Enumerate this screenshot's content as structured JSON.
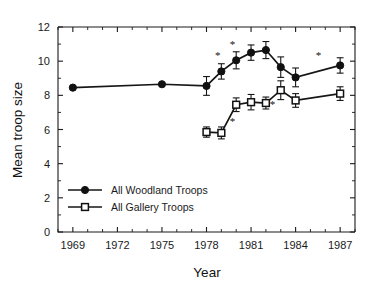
{
  "chart_data": {
    "type": "line",
    "title": "",
    "xlabel": "Year",
    "ylabel": "Mean troop size",
    "xlim": [
      1968,
      1988
    ],
    "ylim": [
      0,
      12.8
    ],
    "xticks": [
      1969,
      1972,
      1975,
      1978,
      1981,
      1984,
      1987
    ],
    "xtick_labels": [
      "1969",
      "1972",
      "1975",
      "1978",
      "1981",
      "1984",
      "1987"
    ],
    "xminor_step": 1,
    "yticks": [
      0,
      2,
      4,
      6,
      8,
      10,
      12
    ],
    "ytick_labels": [
      "0",
      "2",
      "4",
      "6",
      "8",
      "10",
      "12"
    ],
    "yminor_step": 1,
    "grid": false,
    "legend_position": "lower-left-inside",
    "error_bar_type": "standard error",
    "series": [
      {
        "name": "All Woodland Troops",
        "marker": "filled-circle",
        "x": [
          1969,
          1975,
          1978,
          1979,
          1980,
          1981,
          1982,
          1983,
          1984,
          1987
        ],
        "values": [
          8.45,
          8.65,
          8.55,
          9.4,
          10.05,
          10.5,
          10.65,
          9.65,
          9.05,
          9.75
        ],
        "errors": [
          0.0,
          0.0,
          0.55,
          0.45,
          0.5,
          0.45,
          0.5,
          0.6,
          0.55,
          0.45
        ]
      },
      {
        "name": "All Gallery Troops",
        "marker": "open-square",
        "x": [
          1978,
          1979,
          1980,
          1981,
          1982,
          1983,
          1984,
          1987
        ],
        "values": [
          5.85,
          5.8,
          7.45,
          7.6,
          7.55,
          8.3,
          7.7,
          8.1
        ],
        "errors": [
          0.3,
          0.35,
          0.4,
          0.45,
          0.35,
          0.55,
          0.4,
          0.4
        ]
      }
    ],
    "annotations": [
      {
        "text": "*",
        "x": 1978.75,
        "y": 10.1,
        "series": "All Woodland Troops"
      },
      {
        "text": "*",
        "x": 1979.75,
        "y": 10.75,
        "series": "All Woodland Troops"
      },
      {
        "text": "*",
        "x": 1985.55,
        "y": 10.15,
        "series": "All Woodland Troops"
      },
      {
        "text": "*",
        "x": 1979.75,
        "y": 6.25,
        "series": "All Gallery Troops"
      },
      {
        "text": "*",
        "x": 1982.45,
        "y": 7.25,
        "series": "All Gallery Troops"
      }
    ]
  },
  "legend": {
    "items": [
      {
        "label": "All Woodland Troops",
        "marker": "filled-circle"
      },
      {
        "label": "All Gallery Troops",
        "marker": "open-square"
      }
    ]
  },
  "colors": {
    "foreground": "#111111",
    "background": "#ffffff",
    "marker_fill_open": "#ffffff"
  }
}
